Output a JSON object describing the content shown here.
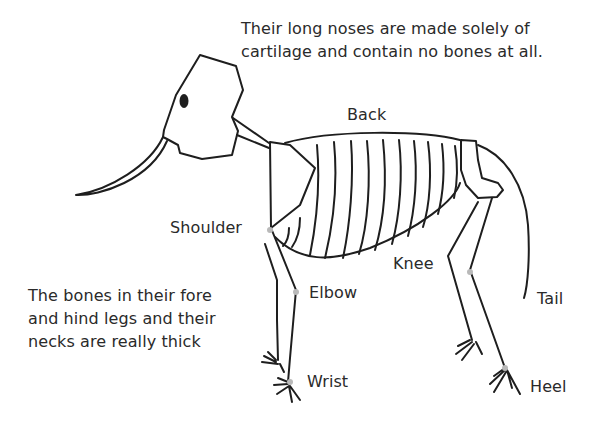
{
  "diagram": {
    "notes": {
      "nose": [
        "Their long noses are made solely of",
        "cartilage and contain no bones at all."
      ],
      "bones": [
        "The bones in their fore",
        "and hind legs and their",
        "necks are really thick"
      ]
    },
    "labels": {
      "back": "Back",
      "shoulder": "Shoulder",
      "elbow": "Elbow",
      "wrist": "Wrist",
      "knee": "Knee",
      "tail": "Tail",
      "heel": "Heel"
    },
    "colors": {
      "line": "#1e1e1e",
      "text": "#2a2a2a",
      "joint": "#b9b9b9",
      "background": "#ffffff"
    }
  }
}
